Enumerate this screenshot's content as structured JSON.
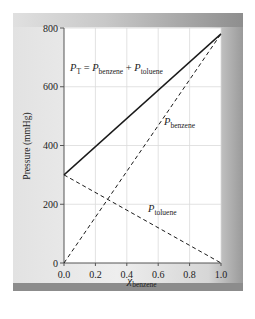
{
  "chart_data": {
    "type": "line",
    "title": "",
    "xlabel": "χ_benzene",
    "xlabel_main": "χ",
    "xlabel_sub": "benzene",
    "ylabel": "Pressure (mmHg)",
    "xlim": [
      0.0,
      1.0
    ],
    "ylim": [
      0,
      800
    ],
    "grid": true,
    "x_ticks": [
      "0.0",
      "0.2",
      "0.4",
      "0.6",
      "0.8",
      "1.0"
    ],
    "y_ticks": [
      "0",
      "200",
      "400",
      "600",
      "800"
    ],
    "series": [
      {
        "name": "P_T = P_benzene + P_toluene",
        "style": "solid",
        "x": [
          0.0,
          1.0
        ],
        "y": [
          300,
          780
        ]
      },
      {
        "name": "P_benzene",
        "style": "dashed",
        "x": [
          0.0,
          1.0
        ],
        "y": [
          0,
          780
        ]
      },
      {
        "name": "P_toluene",
        "style": "dashed",
        "x": [
          0.0,
          1.0
        ],
        "y": [
          300,
          0
        ]
      }
    ],
    "annotations": {
      "total": {
        "main": "P",
        "sub": "T",
        "eq": " = ",
        "p1": "P",
        "p1_sub": "benzene",
        "plus": " + ",
        "p2": "P",
        "p2_sub": "toluene"
      },
      "benzene": {
        "main": "P",
        "sub": "benzene"
      },
      "toluene": {
        "main": "P",
        "sub": "toluene"
      }
    },
    "colors": {
      "line": "#1a1a1a",
      "grid": "#d9d9d9",
      "plot_bg": "#ffffff"
    }
  }
}
